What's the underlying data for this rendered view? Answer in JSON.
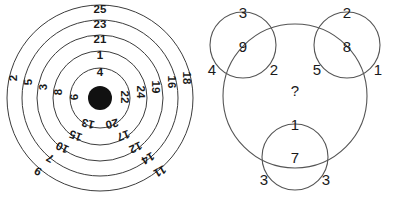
{
  "figure": {
    "title": "",
    "panels": [
      "concentric-target",
      "three-circles"
    ]
  },
  "target": {
    "name": "concentric-target",
    "center_marker": "filled-dot",
    "ring_count": 5,
    "rings": [
      {
        "index": 1,
        "position": "outermost",
        "labels": {
          "top": "25",
          "left": "2",
          "right": "18",
          "bottom_left": "9",
          "bottom_right": "11"
        }
      },
      {
        "index": 2,
        "labels": {
          "top": "23",
          "left": "5",
          "right": "16",
          "bottom_left": "7",
          "bottom_right": "14"
        }
      },
      {
        "index": 3,
        "labels": {
          "top": "21",
          "left": "3",
          "right": "19",
          "bottom_left": "10",
          "bottom_right": "12"
        }
      },
      {
        "index": 4,
        "labels": {
          "top": "1",
          "left": "8",
          "right": "24",
          "bottom_left": "15",
          "bottom_right": "17"
        }
      },
      {
        "index": 5,
        "position": "innermost",
        "labels": {
          "top": "4",
          "left": "6",
          "right": "22",
          "bottom_left": "13",
          "bottom_right": "20"
        }
      }
    ],
    "all_numbers": [
      25,
      23,
      21,
      1,
      4,
      2,
      5,
      3,
      8,
      6,
      18,
      16,
      19,
      24,
      22,
      9,
      7,
      10,
      15,
      13,
      11,
      14,
      12,
      17,
      20
    ]
  },
  "circles": {
    "name": "three-circles",
    "unknown_marker": "?",
    "groups": [
      {
        "id": "top-left",
        "top": "3",
        "center": "9",
        "left": "4",
        "right": "2"
      },
      {
        "id": "top-right",
        "top": "2",
        "center": "8",
        "left": "5",
        "right": "1"
      },
      {
        "id": "bottom",
        "top": "1",
        "center": "7",
        "left": "3",
        "right": "3"
      }
    ]
  },
  "colors": {
    "stroke": "#3c3c3c",
    "text": "#1a1a1a",
    "dot": "#111111",
    "background": "#ffffff"
  }
}
